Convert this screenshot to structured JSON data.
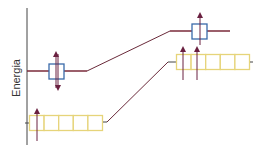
{
  "diagram": {
    "axis_label": "Energia",
    "colors": {
      "axis": "#444444",
      "level_line": "#7a2a3a",
      "connector": "#6a2a3a",
      "d_orbital_box": "#3a6aaa",
      "s_orbital_box": "#e6d47a",
      "electron_arrow": "#6a2040"
    },
    "left_levels": [
      {
        "name": "upper-orbital",
        "type": "single-box",
        "box_color": "blue",
        "electrons": "up-down (paired arrow)"
      },
      {
        "name": "lower-orbital",
        "type": "five-box",
        "box_color": "yellow",
        "electrons": "1 up"
      }
    ],
    "right_levels": [
      {
        "name": "upper-orbital",
        "type": "single-box",
        "box_color": "blue",
        "electrons": "1 up"
      },
      {
        "name": "lower-orbital",
        "type": "five-box",
        "box_color": "yellow",
        "electrons": "2 up"
      }
    ]
  }
}
